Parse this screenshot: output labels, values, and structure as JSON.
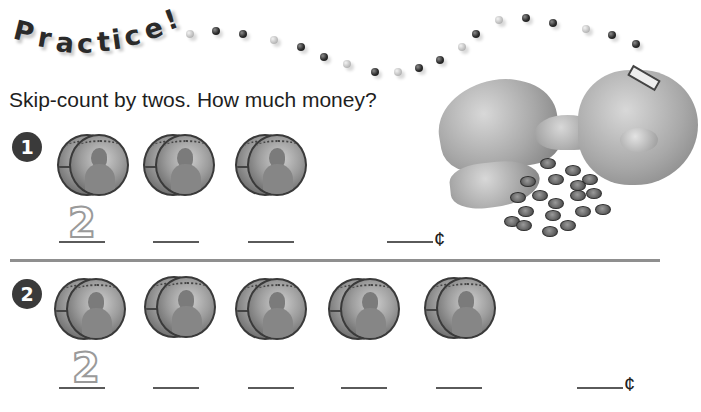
{
  "header": {
    "title_letters": [
      "P",
      "r",
      "a",
      "c",
      "t",
      "i",
      "c",
      "e",
      "!"
    ]
  },
  "instruction": "Skip-count by twos. How much money?",
  "problems": [
    {
      "number": "1",
      "coin_groups": 3,
      "coin_group_description": "pair of pennies",
      "blanks": [
        "2",
        "",
        ""
      ],
      "total_blank": "",
      "unit": "¢"
    },
    {
      "number": "2",
      "coin_groups": 5,
      "coin_group_description": "pair of pennies",
      "blanks": [
        "2",
        "",
        "",
        "",
        ""
      ],
      "total_blank": "",
      "unit": "¢"
    }
  ],
  "illustration": {
    "description": "broken piggy bank with pennies",
    "icon": "piggy-bank-icon"
  },
  "colors": {
    "text": "#1e1e1e",
    "badge": "#3a3a3a",
    "divider": "#8f8f8f",
    "traced_digit": "#9a9a9a"
  }
}
